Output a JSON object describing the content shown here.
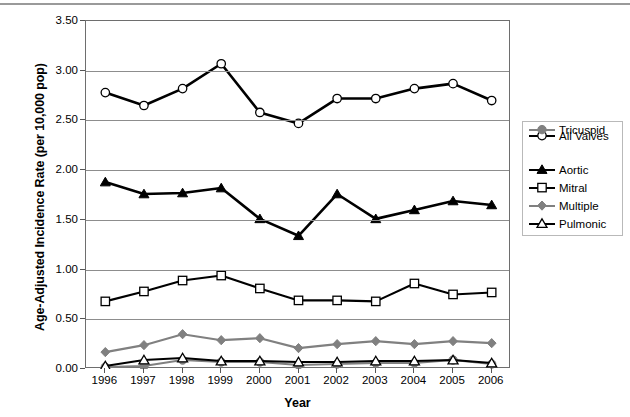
{
  "chart_data": {
    "type": "line",
    "title": "",
    "xlabel": "Year",
    "ylabel": "Age-Adjusted Incidence Rate (per 10,000 pop)",
    "categories": [
      "1996",
      "1997",
      "1998",
      "1999",
      "2000",
      "2001",
      "2002",
      "2003",
      "2004",
      "2005",
      "2006"
    ],
    "x": [
      1996,
      1997,
      1998,
      1999,
      2000,
      2001,
      2002,
      2003,
      2004,
      2005,
      2006
    ],
    "ylim": [
      0.0,
      3.5
    ],
    "ytick_labels": [
      "0.00",
      "0.50",
      "1.00",
      "1.50",
      "2.00",
      "2.50",
      "3.00",
      "3.50"
    ],
    "yticks": [
      0.0,
      0.5,
      1.0,
      1.5,
      2.0,
      2.5,
      3.0,
      3.5
    ],
    "grid": "horizontal",
    "legend_position": "right",
    "series": [
      {
        "name": "All Valves",
        "marker": "circle-open",
        "color": "#000000",
        "values": [
          2.78,
          2.65,
          2.82,
          3.07,
          2.58,
          2.47,
          2.72,
          2.72,
          2.82,
          2.87,
          2.7
        ]
      },
      {
        "name": "Aortic",
        "marker": "triangle-filled",
        "color": "#000000",
        "values": [
          1.88,
          1.76,
          1.77,
          1.82,
          1.51,
          1.34,
          1.76,
          1.51,
          1.6,
          1.69,
          1.65
        ]
      },
      {
        "name": "Mitral",
        "marker": "square-open",
        "color": "#000000",
        "values": [
          0.68,
          0.78,
          0.89,
          0.94,
          0.81,
          0.69,
          0.69,
          0.68,
          0.86,
          0.75,
          0.77
        ]
      },
      {
        "name": "Multiple",
        "marker": "diamond-filled",
        "color": "#808080",
        "values": [
          0.17,
          0.24,
          0.35,
          0.29,
          0.31,
          0.21,
          0.25,
          0.28,
          0.25,
          0.28,
          0.26
        ]
      },
      {
        "name": "Pulmonic",
        "marker": "triangle-open",
        "color": "#000000",
        "values": [
          0.03,
          0.09,
          0.11,
          0.08,
          0.08,
          0.07,
          0.07,
          0.08,
          0.08,
          0.09,
          0.06
        ]
      },
      {
        "name": "Tricuspid",
        "marker": "circle-filled",
        "color": "#808080",
        "values": [
          0.02,
          0.03,
          0.09,
          0.07,
          0.07,
          0.04,
          0.05,
          0.06,
          0.06,
          0.09,
          0.05
        ]
      }
    ]
  },
  "legend": {
    "items": [
      {
        "label": "All Valves"
      },
      {
        "label": "Aortic"
      },
      {
        "label": "Mitral"
      },
      {
        "label": "Multiple"
      },
      {
        "label": "Pulmonic"
      },
      {
        "label": "Tricuspid"
      }
    ]
  }
}
